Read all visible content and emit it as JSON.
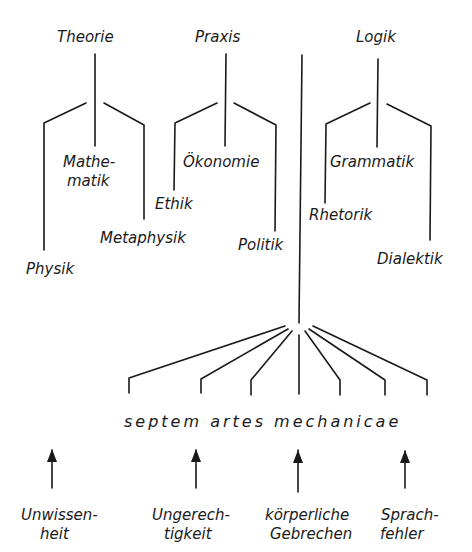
{
  "diagram": {
    "roots": {
      "theorie": "Theorie",
      "praxis": "Praxis",
      "logik": "Logik"
    },
    "theorie_children": {
      "physik": "Physik",
      "mathematik_1": "Mathe-",
      "mathematik_2": "matik",
      "metaphysik": "Metaphysik"
    },
    "praxis_children": {
      "ethik": "Ethik",
      "oekonomie": "Ökonomie",
      "politik": "Politik"
    },
    "logik_children": {
      "rhetorik": "Rhetorik",
      "grammatik": "Grammatik",
      "dialektik": "Dialektik"
    },
    "mechanicae": {
      "title": "septem artes mechanicae",
      "branch_count": 7
    },
    "causes": [
      {
        "line1": "Unwissen-",
        "line2": "heit"
      },
      {
        "line1": "Ungerech-",
        "line2": "tigkeit"
      },
      {
        "line1": "körperliche",
        "line2": "Gebrechen"
      },
      {
        "line1": "Sprach-",
        "line2": "fehler"
      }
    ],
    "colors": {
      "ink": "#1a1a1a",
      "paper": "#ffffff"
    }
  }
}
